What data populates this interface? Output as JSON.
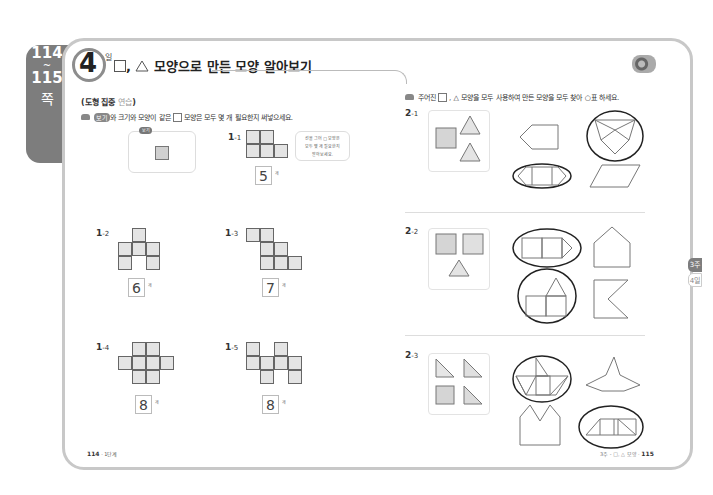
{
  "side_tab": {
    "from": "114",
    "tilde": "~",
    "to": "115",
    "suffix": "쪽"
  },
  "header": {
    "day_number": "4",
    "day_label": "일",
    "title_suffix": "모양으로 만든 모양 알아보기",
    "separator": ","
  },
  "left": {
    "section_label": "도형 집중",
    "section_label_light": "연습",
    "instruction": {
      "pill": "보기",
      "part1": "와 크기와 모양이 같은",
      "part2": "모양은 모두 몇 개 필요한지 써넣으세요."
    },
    "bogi_tag": "보기",
    "hint": {
      "line1": "선을 그어",
      "line2": "모양은",
      "line3": "모두 몇 개 필요한지",
      "line4": "알아보세요."
    },
    "unit": "개",
    "problems": [
      {
        "label": "1",
        "sub": "-1",
        "answer": "5"
      },
      {
        "label": "1",
        "sub": "-2",
        "answer": "6"
      },
      {
        "label": "1",
        "sub": "-3",
        "answer": "7"
      },
      {
        "label": "1",
        "sub": "-4",
        "answer": "8"
      },
      {
        "label": "1",
        "sub": "-5",
        "answer": "8"
      }
    ]
  },
  "right": {
    "instruction": {
      "part1": "주어진",
      "part2": "모양을 모두 사용하여 만든 모양을 모두 찾아",
      "part3": "표 하세요."
    },
    "problems": [
      {
        "label": "2",
        "sub": "-1"
      },
      {
        "label": "2",
        "sub": "-2"
      },
      {
        "label": "2",
        "sub": "-3"
      }
    ],
    "chapter_tabs": [
      {
        "label": "3주",
        "active": true
      },
      {
        "label": "4일",
        "active": false
      }
    ]
  },
  "footer": {
    "left_page": "114",
    "left_text": "· 1단계",
    "right_text": "3주 - □, △ 모양 ·",
    "right_page": "115"
  },
  "colors": {
    "tab_gray": "#7d7d7d",
    "border": "#c8c8c8",
    "cell_fill": "#e4e4e4",
    "circle": "#222222"
  }
}
